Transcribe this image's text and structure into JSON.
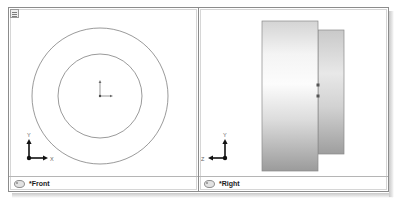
{
  "window": {
    "corner_widget_name": "viewport-layout-control",
    "border_color": "#8c8c8c",
    "background_color": "#ffffff"
  },
  "viewports": [
    {
      "id": "front",
      "label": "*Front",
      "icon": "viewport-title-icon",
      "projection": "parallel",
      "display_mode": "wireframe",
      "axes": {
        "vertical": "Y",
        "horizontal": "X",
        "horizontal_direction": "right"
      },
      "geometry": {
        "type": "concentric-circles",
        "center_x": 91,
        "center_y": 88,
        "outer_radius": 68,
        "inner_radius": 42,
        "stroke_color": "#6f6f6f",
        "stroke_width": 0.7,
        "origin_marker": true
      }
    },
    {
      "id": "right",
      "label": "*Right",
      "icon": "viewport-title-icon",
      "projection": "parallel",
      "display_mode": "shaded",
      "axes": {
        "vertical": "Y",
        "horizontal": "Z",
        "horizontal_direction": "left"
      },
      "geometry": {
        "type": "extruded-rings",
        "stroke_color": "#8a8a8a",
        "faces": [
          {
            "name": "inner-ring-face",
            "x": 119,
            "y": 22,
            "width": 26,
            "height": 124,
            "gradient_top": "#c9c9c9",
            "gradient_mid": "#e6e6e6",
            "gradient_bottom": "#9e9e9e"
          },
          {
            "name": "outer-ring-face",
            "x": 63,
            "y": 13,
            "width": 56,
            "height": 150,
            "gradient_top": "#d7d7d7",
            "gradient_mid": "#fbfbfb",
            "gradient_bottom": "#9b9b9b"
          }
        ],
        "edge_markers": [
          {
            "x": 119,
            "y": 77
          },
          {
            "x": 119,
            "y": 88
          }
        ]
      }
    }
  ],
  "colors": {
    "frame_border": "#8c8c8c",
    "divider": "#8c8c8c",
    "title_separator": "#b5b5b5",
    "axis_stroke": "#1a1a1a",
    "axis_label": "#555555",
    "shadow": "#c9c9c9"
  }
}
